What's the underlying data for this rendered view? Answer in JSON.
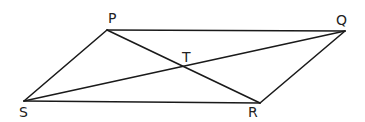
{
  "figure": {
    "type": "parallelogram with diagonals",
    "stroke_color": "#1a1a1a",
    "points": {
      "P": {
        "label": "P",
        "x": 107,
        "y": 30
      },
      "Q": {
        "label": "Q",
        "x": 345,
        "y": 31
      },
      "R": {
        "label": "R",
        "x": 260,
        "y": 103
      },
      "S": {
        "label": "S",
        "x": 24,
        "y": 101
      },
      "T": {
        "label": "T",
        "x": 183,
        "y": 67
      }
    },
    "segments": [
      "PQ",
      "QR",
      "RS",
      "SP",
      "PR",
      "SQ"
    ],
    "intersection": "T"
  }
}
